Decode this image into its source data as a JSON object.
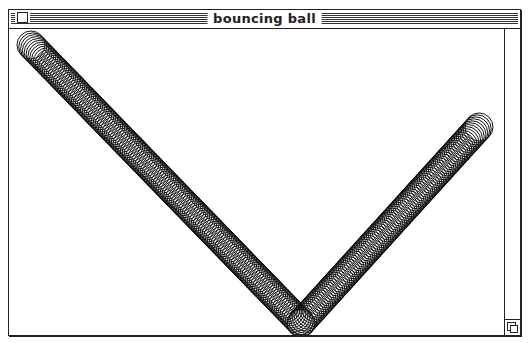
{
  "window": {
    "title": "bouncing ball",
    "close_box_icon": "close-box-icon",
    "size_box_icon": "size-box-icon"
  },
  "animation": {
    "ball_radius": 14,
    "stroke_color": "#111111",
    "background": "#ffffff",
    "step": 2.6,
    "path": [
      {
        "x": 22,
        "y": 16
      },
      {
        "x": 292,
        "y": 294
      },
      {
        "x": 470,
        "y": 98
      }
    ]
  }
}
